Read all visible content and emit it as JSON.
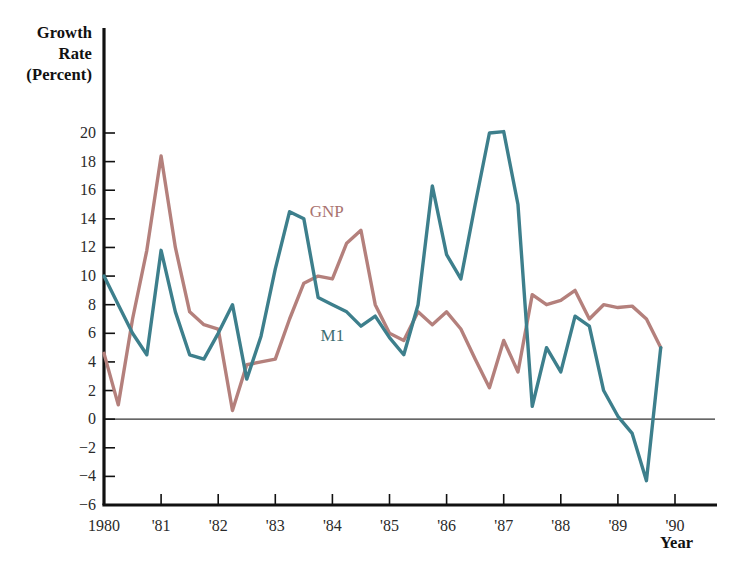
{
  "figure": {
    "yaxis_title": "Growth\nRate\n(Percent)",
    "yaxis_title_lines": [
      "Growth",
      "Rate",
      "(Percent)"
    ],
    "xaxis_title": "Year",
    "background_color": "#ffffff"
  },
  "series_labels": {
    "gnp": "GNP",
    "m1": "M1"
  },
  "chart_data": {
    "type": "line",
    "title": "",
    "subtitle": "",
    "xlabel": "Year",
    "ylabel": "Growth Rate (Percent)",
    "xlim": [
      1980,
      1990
    ],
    "ylim": [
      -6,
      20
    ],
    "ytick_values": [
      20,
      18,
      16,
      14,
      12,
      10,
      8,
      6,
      4,
      2,
      0,
      -2,
      -4,
      -6
    ],
    "ytick_labels": [
      "20",
      "18",
      "16",
      "14",
      "12",
      "10",
      "8",
      "6",
      "4",
      "2",
      "0",
      "−2",
      "−4",
      "−6"
    ],
    "xtick_values": [
      1980,
      1981,
      1982,
      1983,
      1984,
      1985,
      1986,
      1987,
      1988,
      1989,
      1990
    ],
    "xtick_labels": [
      "1980",
      "'81",
      "'82",
      "'83",
      "'84",
      "'85",
      "'86",
      "'87",
      "'88",
      "'89",
      "'90"
    ],
    "grid": false,
    "zero_line": true,
    "legend_position": "in-plot-annotations",
    "x_unit": "quarter",
    "x": [
      1980.0,
      1980.25,
      1980.5,
      1980.75,
      1981.0,
      1981.25,
      1981.5,
      1981.75,
      1982.0,
      1982.25,
      1982.5,
      1982.75,
      1983.0,
      1983.25,
      1983.5,
      1983.75,
      1984.0,
      1984.25,
      1984.5,
      1984.75,
      1985.0,
      1985.25,
      1985.5,
      1985.75,
      1986.0,
      1986.25,
      1986.5,
      1986.75,
      1987.0,
      1987.25,
      1987.5,
      1987.75,
      1988.0,
      1988.25,
      1988.5,
      1988.75,
      1989.0,
      1989.25,
      1989.5,
      1989.75
    ],
    "series": [
      {
        "name": "GNP",
        "color": "#b4807c",
        "values": [
          4.6,
          1.0,
          7.0,
          11.8,
          18.4,
          12.0,
          7.5,
          6.6,
          6.3,
          0.6,
          3.8,
          4.0,
          4.2,
          7.0,
          9.5,
          10.0,
          9.8,
          12.3,
          13.2,
          8.0,
          6.0,
          5.5,
          7.5,
          6.6,
          7.5,
          6.3,
          4.2,
          2.2,
          5.5,
          3.3,
          8.7,
          8.0,
          8.3,
          9.0,
          7.0,
          8.0,
          7.8,
          7.9,
          7.0,
          5.0
        ]
      },
      {
        "name": "M1",
        "color": "#3d7f8c",
        "values": [
          10.0,
          8.0,
          6.0,
          4.5,
          11.8,
          7.5,
          4.5,
          4.2,
          6.0,
          8.0,
          2.8,
          5.8,
          10.5,
          14.5,
          14.0,
          8.5,
          8.0,
          7.5,
          6.5,
          7.2,
          5.7,
          4.5,
          8.0,
          16.3,
          11.5,
          9.8,
          15.0,
          20.0,
          20.1,
          15.0,
          0.9,
          5.0,
          3.3,
          7.2,
          6.5,
          2.0,
          0.2,
          -1.0,
          -4.3,
          5.0
        ]
      }
    ],
    "annotations": [
      {
        "text": "GNP",
        "x": 1983.9,
        "y": 14.5,
        "series": "GNP"
      },
      {
        "text": "M1",
        "x": 1984.0,
        "y": 5.8,
        "series": "M1"
      }
    ]
  },
  "geometry": {
    "plot_left": 104,
    "plot_right": 675,
    "y_top_px": 133,
    "y_bottom_px": 505,
    "axis_color": "#111111",
    "zero_line_color": "#333333"
  }
}
